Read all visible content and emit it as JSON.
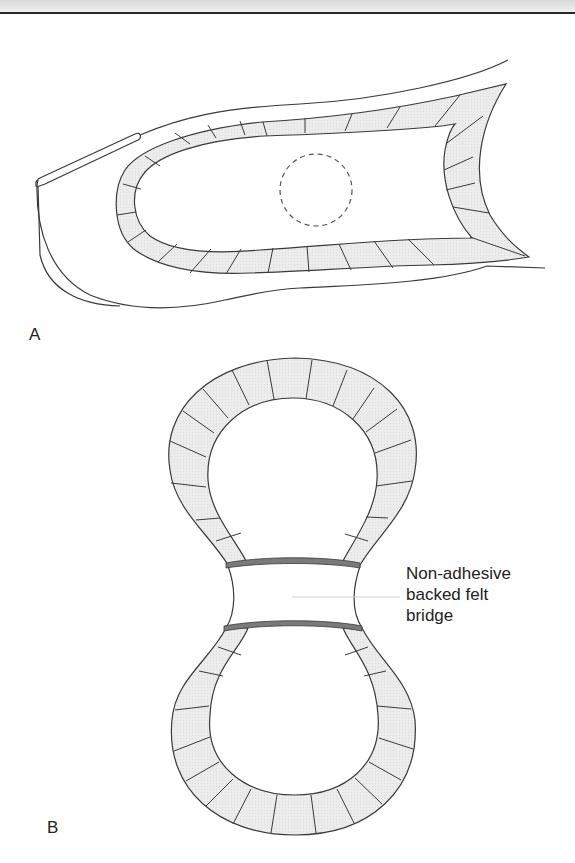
{
  "figure": {
    "panels": [
      {
        "id": "A",
        "label": "A",
        "description": "Side view of toe with U-shaped padded felt aperture around lesion (dashed circle)"
      },
      {
        "id": "B",
        "label": "B",
        "description": "Figure-of-eight felt padding joined by a central bridge"
      }
    ],
    "callout": {
      "lines": [
        "Non-adhesive",
        "backed felt",
        "bridge"
      ]
    },
    "colors": {
      "felt_fill": "#ebebeb",
      "outline": "#3a3a3a",
      "bridge_band": "#7a7a7a",
      "background": "#ffffff"
    }
  }
}
